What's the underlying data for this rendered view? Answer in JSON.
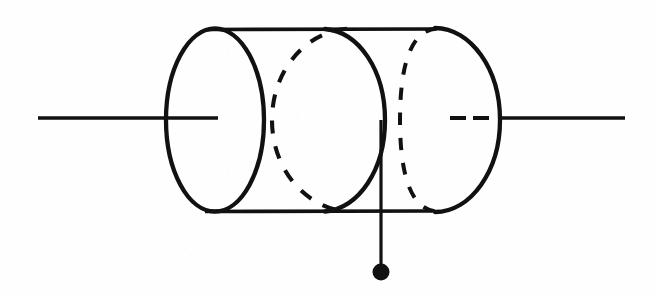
{
  "figure": {
    "title": "Tapped cylindrical coil (inductor) schematic",
    "type": "line-drawing",
    "background_color": "#fefefe",
    "stroke_color": "#111111",
    "canvas": {
      "width": 654,
      "height": 298
    }
  },
  "geometry": {
    "axis_y": 118,
    "cylinder": {
      "left_cap_center_x": 215,
      "right_cap_center_x": 435,
      "center_y": 120,
      "radius_x_left": 50,
      "radius_x_right": 65,
      "radius_y": 92,
      "top_rule_y": 29,
      "bottom_rule_y": 211,
      "top_rule_x1": 208,
      "top_rule_x2": 436,
      "bottom_rule_x1": 205,
      "bottom_rule_x2": 432
    },
    "left_lead": {
      "x1": 38,
      "x2": 218,
      "y": 118,
      "width": 3.4
    },
    "right_lead": {
      "x1": 500,
      "x2": 625,
      "y": 118,
      "width": 3.4
    },
    "hidden_axis_dashes": [
      {
        "x1": 450,
        "x2": 466,
        "y": 118
      },
      {
        "x1": 473,
        "x2": 489,
        "y": 118
      }
    ],
    "tap": {
      "x": 381,
      "y_top": 120,
      "y_bottom": 264,
      "dot_center_x": 381,
      "dot_center_y": 272,
      "dot_radius": 8.5,
      "line_width": 3.2
    },
    "turns": [
      {
        "name": "turn-1-front",
        "style": "solid",
        "center_x": 215,
        "rx": 50,
        "half": "full"
      },
      {
        "name": "turn-2-back",
        "style": "dashed",
        "center_x": 325,
        "rx": 53,
        "half": "left"
      },
      {
        "name": "turn-2-front",
        "style": "solid",
        "center_x": 325,
        "rx": 60,
        "half": "right"
      },
      {
        "name": "turn-3-back",
        "style": "dashed",
        "center_x": 435,
        "rx": 30,
        "half": "left"
      },
      {
        "name": "turn-3-front",
        "style": "solid",
        "center_x": 435,
        "rx": 65,
        "half": "right"
      }
    ],
    "stroke_widths": {
      "outline": 4.2,
      "rule": 3.4,
      "dashed": 4.0
    },
    "dash_patterns": {
      "turn_2_back": "13 13",
      "turn_3_back": "12 13"
    }
  },
  "labels": {
    "left_terminal": "",
    "right_terminal": "",
    "tap_terminal": "",
    "component": ""
  }
}
